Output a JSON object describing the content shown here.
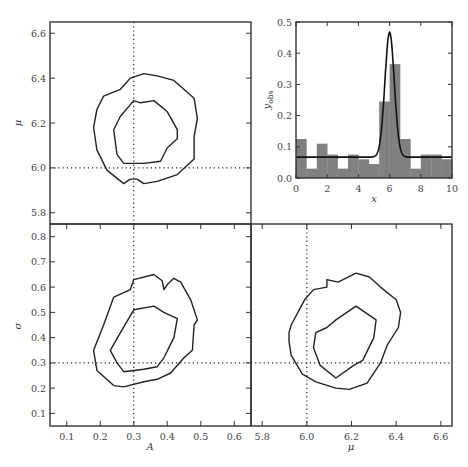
{
  "chart_data": [
    {
      "type": "contour",
      "panel": "top-left",
      "xlabel": "A",
      "ylabel": "μ",
      "xlim": [
        0.05,
        0.65
      ],
      "ylim": [
        5.75,
        6.65
      ],
      "y_ticks": [
        "5.8",
        "6.0",
        "6.2",
        "6.4",
        "6.6"
      ],
      "true_values": {
        "x": 0.3,
        "y": 6.0
      },
      "contours": [
        {
          "level": "inner",
          "points": [
            [
              0.3,
              6.3
            ],
            [
              0.32,
              6.29
            ],
            [
              0.36,
              6.3
            ],
            [
              0.4,
              6.25
            ],
            [
              0.43,
              6.17
            ],
            [
              0.43,
              6.13
            ],
            [
              0.4,
              6.09
            ],
            [
              0.38,
              6.03
            ],
            [
              0.33,
              6.02
            ],
            [
              0.27,
              6.02
            ],
            [
              0.25,
              6.06
            ],
            [
              0.24,
              6.17
            ],
            [
              0.26,
              6.23
            ],
            [
              0.3,
              6.3
            ]
          ]
        },
        {
          "level": "outer",
          "points": [
            [
              0.29,
              6.4
            ],
            [
              0.33,
              6.42
            ],
            [
              0.37,
              6.41
            ],
            [
              0.42,
              6.39
            ],
            [
              0.48,
              6.31
            ],
            [
              0.49,
              6.22
            ],
            [
              0.48,
              6.14
            ],
            [
              0.48,
              6.04
            ],
            [
              0.43,
              5.97
            ],
            [
              0.37,
              5.94
            ],
            [
              0.33,
              5.93
            ],
            [
              0.31,
              5.95
            ],
            [
              0.29,
              5.95
            ],
            [
              0.27,
              5.93
            ],
            [
              0.22,
              5.99
            ],
            [
              0.19,
              6.08
            ],
            [
              0.18,
              6.18
            ],
            [
              0.19,
              6.26
            ],
            [
              0.21,
              6.32
            ],
            [
              0.26,
              6.35
            ],
            [
              0.29,
              6.4
            ]
          ]
        }
      ]
    },
    {
      "type": "bar",
      "panel": "top-right-inset",
      "xlabel": "x",
      "ylabel": "y_obs",
      "xlim": [
        0,
        10
      ],
      "ylim": [
        0,
        0.5
      ],
      "x_ticks": [
        "0",
        "2",
        "4",
        "6",
        "8",
        "10"
      ],
      "y_ticks": [
        "0.0",
        "0.1",
        "0.2",
        "0.3",
        "0.4",
        "0.5"
      ],
      "bin_edges": [
        0,
        0.667,
        1.333,
        2,
        2.667,
        3.333,
        4,
        4.667,
        5.333,
        6,
        6.667,
        7.333,
        8,
        8.667,
        9.333,
        10
      ],
      "values": [
        0.125,
        0.03,
        0.11,
        0.075,
        0.03,
        0.075,
        0.06,
        0.045,
        0.245,
        0.365,
        0.125,
        0.03,
        0.075,
        0.075,
        0.06
      ],
      "bar_color": "#808080",
      "model_curve": {
        "type": "gaussian_plus_constant",
        "amplitude": 0.4,
        "mu": 6.0,
        "sigma": 0.3,
        "background": 0.067
      }
    },
    {
      "type": "contour",
      "panel": "bottom-left",
      "xlabel": "A",
      "ylabel": "σ",
      "xlim": [
        0.05,
        0.65
      ],
      "ylim": [
        0.05,
        0.85
      ],
      "x_ticks": [
        "0.1",
        "0.2",
        "0.3",
        "0.4",
        "0.5",
        "0.6"
      ],
      "y_ticks": [
        "0.1",
        "0.2",
        "0.3",
        "0.4",
        "0.5",
        "0.6",
        "0.7",
        "0.8"
      ],
      "true_values": {
        "x": 0.3,
        "y": 0.3
      },
      "contours": [
        {
          "level": "inner",
          "points": [
            [
              0.3,
              0.51
            ],
            [
              0.36,
              0.525
            ],
            [
              0.39,
              0.5
            ],
            [
              0.43,
              0.475
            ],
            [
              0.42,
              0.4
            ],
            [
              0.39,
              0.32
            ],
            [
              0.37,
              0.285
            ],
            [
              0.33,
              0.275
            ],
            [
              0.27,
              0.265
            ],
            [
              0.25,
              0.3
            ],
            [
              0.23,
              0.35
            ],
            [
              0.26,
              0.42
            ],
            [
              0.3,
              0.51
            ]
          ]
        },
        {
          "level": "outer",
          "points": [
            [
              0.3,
              0.63
            ],
            [
              0.36,
              0.65
            ],
            [
              0.385,
              0.625
            ],
            [
              0.39,
              0.59
            ],
            [
              0.4,
              0.61
            ],
            [
              0.42,
              0.635
            ],
            [
              0.44,
              0.62
            ],
            [
              0.47,
              0.55
            ],
            [
              0.49,
              0.47
            ],
            [
              0.48,
              0.45
            ],
            [
              0.475,
              0.35
            ],
            [
              0.45,
              0.32
            ],
            [
              0.41,
              0.26
            ],
            [
              0.37,
              0.235
            ],
            [
              0.33,
              0.225
            ],
            [
              0.27,
              0.205
            ],
            [
              0.24,
              0.21
            ],
            [
              0.19,
              0.27
            ],
            [
              0.18,
              0.35
            ],
            [
              0.21,
              0.45
            ],
            [
              0.24,
              0.56
            ],
            [
              0.29,
              0.59
            ],
            [
              0.3,
              0.63
            ]
          ]
        }
      ]
    },
    {
      "type": "contour",
      "panel": "bottom-right",
      "xlabel": "μ",
      "ylabel": "σ",
      "xlim": [
        5.75,
        6.65
      ],
      "ylim": [
        0.05,
        0.85
      ],
      "x_ticks": [
        "5.8",
        "6.0",
        "6.2",
        "6.4",
        "6.6"
      ],
      "true_values": {
        "x": 6.0,
        "y": 0.3
      },
      "contours": [
        {
          "level": "inner",
          "points": [
            [
              6.13,
              0.47
            ],
            [
              6.22,
              0.525
            ],
            [
              6.31,
              0.47
            ],
            [
              6.3,
              0.4
            ],
            [
              6.25,
              0.31
            ],
            [
              6.21,
              0.29
            ],
            [
              6.13,
              0.24
            ],
            [
              6.06,
              0.29
            ],
            [
              6.03,
              0.36
            ],
            [
              6.04,
              0.42
            ],
            [
              6.09,
              0.44
            ],
            [
              6.13,
              0.47
            ]
          ]
        },
        {
          "level": "outer",
          "points": [
            [
              6.09,
              0.63
            ],
            [
              6.14,
              0.62
            ],
            [
              6.22,
              0.655
            ],
            [
              6.28,
              0.64
            ],
            [
              6.33,
              0.6
            ],
            [
              6.4,
              0.55
            ],
            [
              6.42,
              0.5
            ],
            [
              6.41,
              0.44
            ],
            [
              6.36,
              0.37
            ],
            [
              6.33,
              0.3
            ],
            [
              6.27,
              0.22
            ],
            [
              6.19,
              0.195
            ],
            [
              6.13,
              0.2
            ],
            [
              6.04,
              0.225
            ],
            [
              5.98,
              0.255
            ],
            [
              5.93,
              0.33
            ],
            [
              5.92,
              0.385
            ],
            [
              5.92,
              0.42
            ],
            [
              5.93,
              0.45
            ],
            [
              5.96,
              0.5
            ],
            [
              5.99,
              0.55
            ],
            [
              6.03,
              0.59
            ],
            [
              6.09,
              0.6
            ],
            [
              6.09,
              0.63
            ]
          ]
        }
      ]
    }
  ],
  "labels": {
    "mu": "μ",
    "sigma": "σ",
    "A": "A",
    "x": "x",
    "yobs_main": "y",
    "yobs_sub": "obs"
  }
}
